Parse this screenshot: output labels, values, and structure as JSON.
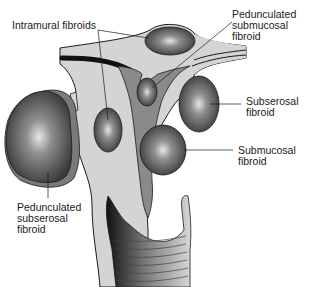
{
  "diagram": {
    "labels": {
      "intramural": "Intramural fibroids",
      "pedunculated_submucosal": "Pedunculated\nsubmucosal\nfibroid",
      "subserosal": "Subserosal\nfibroid",
      "submucosal": "Submucosal\nfibroid",
      "pedunculated_subserosal": "Pedunculated\nsubserosal\nfibroid"
    },
    "colors": {
      "uterine_wall": "#d4d4d4",
      "cavity": "#8a8a8a",
      "fibroid_dark": "#3c3c3c",
      "fibroid_light": "#e8e8e8",
      "outline": "#1a1a1a",
      "tube": "#111111"
    }
  }
}
